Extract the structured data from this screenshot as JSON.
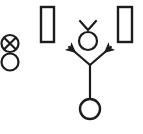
{
  "canvas": {
    "width": 143,
    "height": 134,
    "background": "#ffffff",
    "stroke_color": "#1c1c1c",
    "title": "Play Diagram"
  },
  "diagram": {
    "type": "sports-play-diagram",
    "stroke_width": 2.2,
    "shapes": [
      {
        "id": "crossed-circle-defender",
        "icon": "crossed-circle-icon",
        "label": "",
        "kind": "circle-with-x",
        "cx": 10,
        "cy": 43.5,
        "r": 8.5
      },
      {
        "id": "open-circle-player",
        "icon": "circle-icon",
        "label": "",
        "kind": "circle",
        "cx": 10,
        "cy": 62,
        "r": 8.5
      },
      {
        "id": "rectangle-left",
        "icon": "rectangle-icon",
        "label": "",
        "kind": "rect",
        "x": 41,
        "y": 7,
        "width": 13,
        "height": 35
      },
      {
        "id": "rectangle-right",
        "icon": "rectangle-icon",
        "label": "",
        "kind": "rect",
        "x": 118,
        "y": 7,
        "width": 14,
        "height": 35
      },
      {
        "id": "chevron-marker",
        "icon": "chevron-down-icon",
        "label": "",
        "kind": "chevron",
        "points": "80,21 88,30 96,21"
      },
      {
        "id": "receiver-circle",
        "icon": "circle-icon",
        "label": "",
        "kind": "circle",
        "cx": 88,
        "cy": 41,
        "r": 9
      },
      {
        "id": "route-stem",
        "icon": "line-icon",
        "label": "",
        "kind": "line",
        "x1": 90,
        "y1": 99,
        "x2": 90,
        "y2": 65
      },
      {
        "id": "route-branch-left",
        "icon": "arrow-up-left-icon",
        "label": "",
        "kind": "arrow",
        "x1": 90,
        "y1": 65,
        "x2": 68,
        "y2": 46
      },
      {
        "id": "route-branch-right",
        "icon": "arrow-up-right-icon",
        "label": "",
        "kind": "arrow",
        "x1": 90,
        "y1": 65,
        "x2": 112,
        "y2": 46
      },
      {
        "id": "ball-carrier-circle",
        "icon": "circle-icon",
        "label": "",
        "kind": "circle",
        "cx": 90,
        "cy": 109,
        "r": 10
      }
    ]
  }
}
